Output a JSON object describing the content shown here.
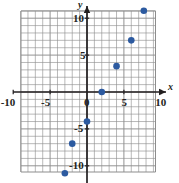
{
  "chart_data": {
    "type": "scatter",
    "title": "",
    "xlabel": "x",
    "ylabel": "y",
    "grid": true,
    "legend": false,
    "xlim": [
      -11,
      9.2
    ],
    "ylim": [
      -11.8,
      11.9
    ],
    "x_ticks": [
      -10,
      -5,
      0,
      5,
      10
    ],
    "y_ticks": [
      -10,
      -5,
      5,
      10
    ],
    "x_tick_labels": [
      "-10",
      "-5",
      "0",
      "5",
      "10"
    ],
    "y_tick_labels": [
      "-10",
      "-5",
      "5",
      "10"
    ],
    "point_color": "#2c5aa0",
    "grid_color": "#8d8d8d",
    "axis_color": "#231f20",
    "series": [
      {
        "name": "points",
        "points": [
          {
            "x": -3,
            "y": -11
          },
          {
            "x": -2,
            "y": -7
          },
          {
            "x": 0,
            "y": -4
          },
          {
            "x": 2,
            "y": 0
          },
          {
            "x": 4,
            "y": 3.5
          },
          {
            "x": 6,
            "y": 7
          },
          {
            "x": 7.7,
            "y": 11
          }
        ]
      }
    ]
  },
  "axis_labels": {
    "x_axis_name": "x",
    "y_axis_name": "y"
  }
}
